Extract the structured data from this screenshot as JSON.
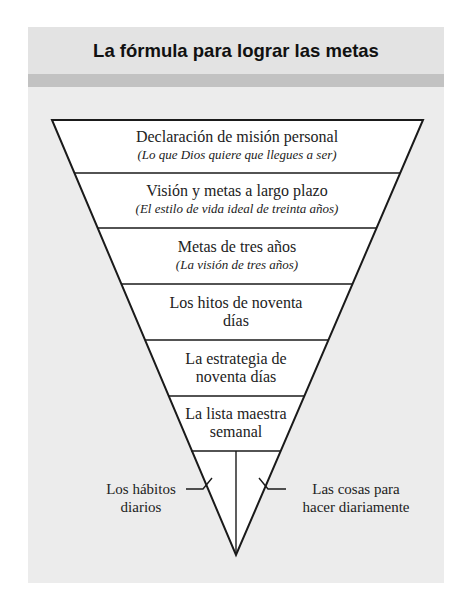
{
  "title": "La fórmula para lograr las metas",
  "colors": {
    "header_bg": "#e3e3e3",
    "stripe": "#c2c2c2",
    "panel_bg": "#ececec",
    "triangle_fill": "#ffffff",
    "line": "#1a1a1a"
  },
  "levels": [
    {
      "main": "Declaración de misión personal",
      "sub": "(Lo que Dios quiere que llegues a ser)"
    },
    {
      "main": "Visión y metas a largo plazo",
      "sub": "(El estilo de vida ideal de treinta años)"
    },
    {
      "main": "Metas de tres años",
      "sub": "(La visión de tres años)"
    },
    {
      "main_line1": "Los hitos de noventa",
      "main_line2": "días"
    },
    {
      "main_line1": "La estrategia de",
      "main_line2": "noventa días"
    },
    {
      "main_line1": "La lista maestra",
      "main_line2": "semanal"
    }
  ],
  "bottom_left": {
    "line1": "Los hábitos",
    "line2": "diarios"
  },
  "bottom_right": {
    "line1": "Las cosas para",
    "line2": "hacer diariamente"
  }
}
